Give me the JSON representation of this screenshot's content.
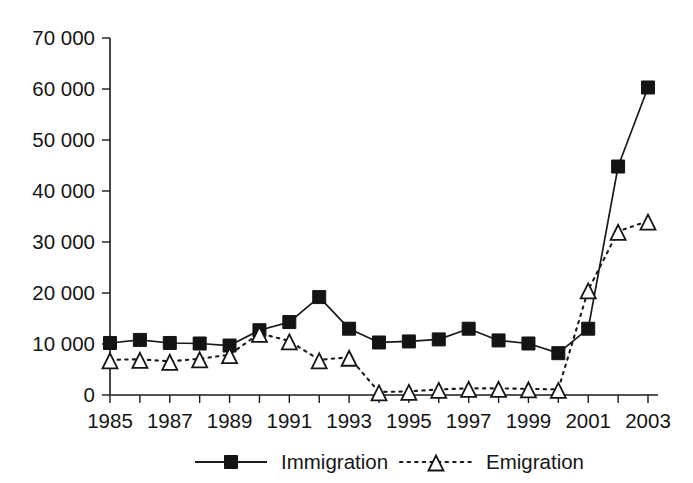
{
  "chart_data": {
    "type": "line",
    "title": "",
    "subtitle": "",
    "xlabel": "",
    "ylabel": "",
    "x": [
      1985,
      1986,
      1987,
      1988,
      1989,
      1990,
      1991,
      1992,
      1993,
      1994,
      1995,
      1996,
      1997,
      1998,
      1999,
      2000,
      2001,
      2002,
      2003
    ],
    "xlim": [
      1985,
      2003
    ],
    "ylim": [
      0,
      70000
    ],
    "ytick_values": [
      0,
      10000,
      20000,
      30000,
      40000,
      50000,
      60000,
      70000
    ],
    "ytick_labels": [
      "0",
      "10 000",
      "20 000",
      "30 000",
      "40 000",
      "50 000",
      "60 000",
      "70 000"
    ],
    "xtick_values": [
      1985,
      1986,
      1987,
      1988,
      1989,
      1990,
      1991,
      1992,
      1993,
      1994,
      1995,
      1996,
      1997,
      1998,
      1999,
      2000,
      2001,
      2002,
      2003
    ],
    "xtick_labels": [
      "1985",
      "",
      "1987",
      "",
      "1989",
      "",
      "1991",
      "",
      "1993",
      "",
      "1995",
      "",
      "1997",
      "",
      "1999",
      "",
      "2001",
      "",
      "2003"
    ],
    "grid": false,
    "legend_position": "bottom",
    "series": [
      {
        "name": "Immigration",
        "marker": "filled-square",
        "linestyle": "solid",
        "color": "#1a1a1a",
        "values": [
          10200,
          10800,
          10200,
          10100,
          9700,
          12700,
          14300,
          19200,
          13000,
          10300,
          10500,
          10900,
          13000,
          10700,
          10100,
          8200,
          13000,
          44800,
          60300
        ]
      },
      {
        "name": "Emigration",
        "marker": "open-triangle",
        "linestyle": "dotted",
        "color": "#1a1a1a",
        "values": [
          6900,
          7000,
          6600,
          7100,
          7900,
          12100,
          10600,
          6900,
          7400,
          600,
          700,
          1100,
          1300,
          1300,
          1200,
          1100,
          20600,
          32100,
          34100
        ]
      }
    ]
  },
  "legend": {
    "entries": [
      {
        "label": "Immigration",
        "marker": "filled-square",
        "linestyle": "solid"
      },
      {
        "label": "Emigration",
        "marker": "open-triangle",
        "linestyle": "dotted"
      }
    ]
  },
  "colors": {
    "ink": "#1a1a1a",
    "background": "#ffffff"
  }
}
